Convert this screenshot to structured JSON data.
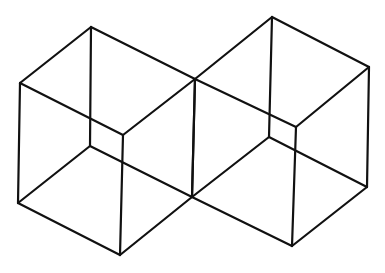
{
  "figure": {
    "title": "Two adjoining wireframe cubes",
    "stroke_color": "#111111",
    "background": "#ffffff"
  },
  "cubes": [
    {
      "name": "left-cube",
      "vertices": {
        "top_back": [
          91,
          27
        ],
        "top_left": [
          20,
          83
        ],
        "top_right": [
          195,
          79
        ],
        "top_front": [
          123,
          135
        ],
        "bottom_back": [
          90,
          146
        ],
        "bottom_left": [
          18,
          203
        ],
        "bottom_right": [
          192,
          197
        ],
        "bottom_front": [
          120,
          255
        ]
      }
    },
    {
      "name": "right-cube",
      "vertices": {
        "top_back": [
          272,
          17
        ],
        "top_left": [
          195,
          79
        ],
        "top_right": [
          369,
          67
        ],
        "top_front": [
          296,
          127
        ],
        "bottom_back": [
          269,
          137
        ],
        "bottom_left": [
          192,
          197
        ],
        "bottom_right": [
          367,
          187
        ],
        "bottom_front": [
          292,
          246
        ]
      }
    }
  ],
  "edges": [
    [
      "top_back",
      "top_left"
    ],
    [
      "top_back",
      "top_right"
    ],
    [
      "top_left",
      "top_front"
    ],
    [
      "top_right",
      "top_front"
    ],
    [
      "bottom_back",
      "bottom_left"
    ],
    [
      "bottom_back",
      "bottom_right"
    ],
    [
      "bottom_left",
      "bottom_front"
    ],
    [
      "bottom_right",
      "bottom_front"
    ],
    [
      "top_back",
      "bottom_back"
    ],
    [
      "top_left",
      "bottom_left"
    ],
    [
      "top_right",
      "bottom_right"
    ],
    [
      "top_front",
      "bottom_front"
    ]
  ]
}
